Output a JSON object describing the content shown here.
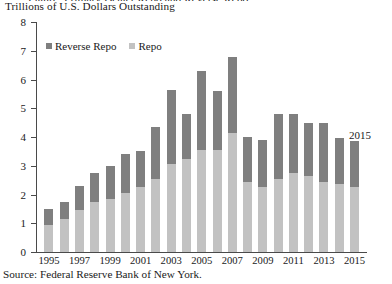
{
  "header": {
    "clipped_title": "Figure: Primary Dealer Repo and Reverse Repo",
    "subtitle": "Trillions of U.S. Dollars Outstanding"
  },
  "legend": {
    "items": [
      {
        "label": "Reverse Repo",
        "color": "#7f7f7f",
        "swatch_icon": "square-swatch-icon"
      },
      {
        "label": "Repo",
        "color": "#c2c2c2",
        "swatch_icon": "square-swatch-icon"
      }
    ]
  },
  "annotation": {
    "label": "2015"
  },
  "source": {
    "text": "Source: Federal Reserve Bank of New York."
  },
  "chart_data": {
    "type": "bar",
    "stacked": true,
    "title": "Trillions of U.S. Dollars Outstanding",
    "xlabel": "",
    "ylabel": "Trillions of U.S. Dollars Outstanding",
    "ylim": [
      0,
      8
    ],
    "ytick_step": 1,
    "yticks": [
      0,
      1,
      2,
      3,
      4,
      5,
      6,
      7,
      8
    ],
    "grid": false,
    "legend_position": "top-left",
    "categories": [
      "1995",
      "1996",
      "1997",
      "1998",
      "1999",
      "2000",
      "2001",
      "2002",
      "2003",
      "2004",
      "2005",
      "2006",
      "2007",
      "2008",
      "2009",
      "2010",
      "2011",
      "2012",
      "2013",
      "2014",
      "2015"
    ],
    "xtick_labels": [
      "1995",
      "1997",
      "1999",
      "2001",
      "2003",
      "2005",
      "2007",
      "2009",
      "2011",
      "2013",
      "2015"
    ],
    "series": [
      {
        "name": "Repo",
        "color": "#c2c2c2",
        "values": [
          0.95,
          1.15,
          1.45,
          1.75,
          1.85,
          2.05,
          2.25,
          2.55,
          3.05,
          3.25,
          3.55,
          3.55,
          4.15,
          2.45,
          2.25,
          2.55,
          2.75,
          2.65,
          2.45,
          2.35,
          2.25
        ]
      },
      {
        "name": "Reverse Repo",
        "color": "#7f7f7f",
        "values": [
          0.55,
          0.6,
          0.85,
          1.0,
          1.15,
          1.35,
          1.25,
          1.8,
          2.6,
          1.55,
          2.75,
          2.05,
          2.65,
          1.55,
          1.65,
          2.25,
          2.05,
          1.85,
          2.05,
          1.6,
          1.6
        ]
      }
    ],
    "totals": [
      1.5,
      1.75,
      2.3,
      2.75,
      3.0,
      3.4,
      3.5,
      4.35,
      5.65,
      4.8,
      6.3,
      5.6,
      6.8,
      4.0,
      3.9,
      4.8,
      4.8,
      4.5,
      4.5,
      3.95,
      3.85
    ]
  }
}
